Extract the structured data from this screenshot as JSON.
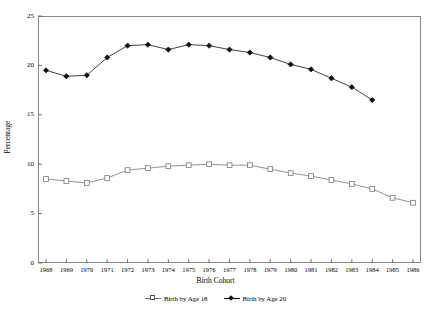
{
  "chart_data": {
    "type": "line",
    "title": "",
    "xlabel": "Birth Cohort",
    "ylabel": "Percentage",
    "categories": [
      "1968",
      "1969",
      "1970",
      "1971",
      "1972",
      "1973",
      "1974",
      "1975",
      "1976",
      "1977",
      "1978",
      "1979",
      "1980",
      "1981",
      "1982",
      "1983",
      "1984",
      "1985",
      "1986"
    ],
    "xlim": [
      1968,
      1986
    ],
    "ylim": [
      0,
      25
    ],
    "yticks": [
      0,
      5,
      10,
      15,
      20,
      25
    ],
    "grid": false,
    "legend_position": "bottom",
    "series": [
      {
        "name": "Birth by Age 18",
        "marker": "open-square",
        "color": "#777777",
        "values": [
          8.5,
          8.3,
          8.1,
          8.6,
          9.4,
          9.6,
          9.8,
          9.9,
          10.0,
          9.9,
          9.9,
          9.5,
          9.1,
          8.8,
          8.4,
          8.0,
          7.5,
          6.6,
          6.1
        ]
      },
      {
        "name": "Birth by Age 20",
        "marker": "filled-diamond",
        "color": "#111111",
        "values": [
          19.5,
          18.9,
          19.0,
          20.8,
          22.0,
          22.1,
          21.6,
          22.1,
          22.0,
          21.6,
          21.3,
          20.8,
          20.1,
          19.6,
          18.7,
          17.8,
          16.5,
          null,
          null
        ]
      }
    ]
  },
  "axis": {
    "y_tick_labels": [
      "0",
      "5",
      "10",
      "15",
      "20",
      "25"
    ],
    "x_tick_labels": [
      "1968",
      "1969",
      "1970",
      "1971",
      "1972",
      "1973",
      "1974",
      "1975",
      "1976",
      "1977",
      "1978",
      "1979",
      "1980",
      "1981",
      "1982",
      "1983",
      "1984",
      "1985",
      "1986"
    ],
    "x_title": "Birth Cohort",
    "y_title": "Percentage"
  },
  "legend": {
    "items": [
      {
        "label": "Birth by Age 18"
      },
      {
        "label": "Birth by Age 20"
      }
    ]
  }
}
